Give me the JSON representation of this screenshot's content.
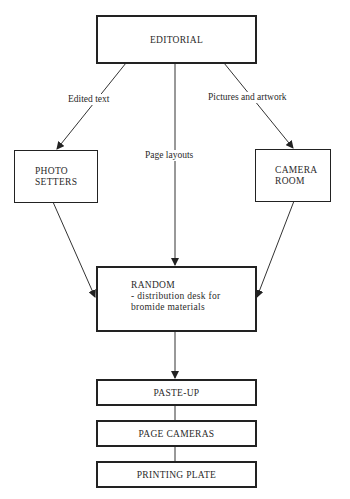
{
  "diagram": {
    "type": "flowchart",
    "nodes": {
      "editorial": {
        "label": "EDITORIAL"
      },
      "photo_setters": {
        "line1": "PHOTO",
        "line2": "SETTERS"
      },
      "camera_room": {
        "line1": "CAMERA",
        "line2": "ROOM"
      },
      "random": {
        "line1": "RANDOM",
        "line2": "- distribution desk for",
        "line3": "bromide materials"
      },
      "paste_up": {
        "label": "PASTE-UP"
      },
      "page_cameras": {
        "label": "PAGE CAMERAS"
      },
      "printing_plate": {
        "label": "PRINTING PLATE"
      }
    },
    "edge_labels": {
      "edited_text": "Edited text",
      "page_layouts": "Page layouts",
      "pictures_and_artwork": "Pictures and artwork"
    },
    "edges": [
      {
        "from": "EDITORIAL",
        "to": "PHOTO SETTERS",
        "label": "Edited text"
      },
      {
        "from": "EDITORIAL",
        "to": "RANDOM",
        "label": "Page layouts"
      },
      {
        "from": "EDITORIAL",
        "to": "CAMERA ROOM",
        "label": "Pictures and artwork"
      },
      {
        "from": "PHOTO SETTERS",
        "to": "RANDOM",
        "label": ""
      },
      {
        "from": "CAMERA ROOM",
        "to": "RANDOM",
        "label": ""
      },
      {
        "from": "RANDOM",
        "to": "PASTE-UP",
        "label": ""
      },
      {
        "from": "PASTE-UP",
        "to": "PAGE CAMERAS",
        "label": ""
      },
      {
        "from": "PAGE CAMERAS",
        "to": "PRINTING PLATE",
        "label": ""
      }
    ]
  }
}
